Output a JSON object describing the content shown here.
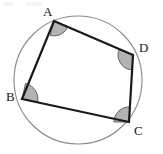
{
  "figure": {
    "type": "cyclic-quadrilateral-in-circle",
    "canvas": {
      "width": 163,
      "height": 154,
      "background": "#ffffff"
    },
    "circle": {
      "name": "circumscribed-circle",
      "cx": 78,
      "cy": 80,
      "r": 64,
      "stroke": "#8a8a8a",
      "stroke_width": 1.1,
      "fill": "none"
    },
    "quadrilateral": {
      "name": "quadrilateral-ABCD",
      "stroke": "#1a1a1a",
      "stroke_width": 2.2,
      "fill": "none",
      "vertex_order": [
        "A",
        "D",
        "C",
        "B"
      ]
    },
    "vertices": [
      {
        "id": "A",
        "label": "A",
        "x": 54,
        "y": 21,
        "label_x": 43,
        "label_y": 5,
        "angle_arc": {
          "radius": 15,
          "start_deg": 23,
          "end_deg": 105,
          "fill": "#b3b3b3",
          "stroke": "#5a5a5a"
        }
      },
      {
        "id": "D",
        "label": "D",
        "x": 133,
        "y": 55,
        "label_x": 139,
        "label_y": 41,
        "angle_arc": {
          "radius": 15,
          "start_deg": 93,
          "end_deg": 203,
          "fill": "#b3b3b3",
          "stroke": "#5a5a5a"
        }
      },
      {
        "id": "C",
        "label": "C",
        "x": 129,
        "y": 122,
        "label_x": 134,
        "label_y": 124,
        "angle_arc": {
          "radius": 15,
          "start_deg": 180,
          "end_deg": 273,
          "fill": "#b3b3b3",
          "stroke": "#5a5a5a"
        }
      },
      {
        "id": "B",
        "label": "B",
        "x": 22,
        "y": 99,
        "label_x": 6,
        "label_y": 90,
        "angle_arc": {
          "radius": 16,
          "start_deg": 283,
          "end_deg": 371,
          "fill": "#b3b3b3",
          "stroke": "#5a5a5a"
        }
      }
    ],
    "edges": [
      {
        "id": "AD",
        "from": "A",
        "to": "D"
      },
      {
        "id": "DC",
        "from": "D",
        "to": "C"
      },
      {
        "id": "CB",
        "from": "C",
        "to": "B"
      },
      {
        "id": "BA",
        "from": "B",
        "to": "A"
      }
    ],
    "artifacts": [
      {
        "name": "scan-smudge-top-left",
        "x": 4,
        "y": 2,
        "width": 9,
        "height": 4
      },
      {
        "name": "scan-smudge-top-center",
        "x": 26,
        "y": 2,
        "width": 16,
        "height": 4
      }
    ]
  }
}
